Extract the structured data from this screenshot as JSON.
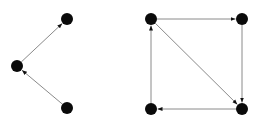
{
  "graphs": [
    {
      "name": "graph-left",
      "nodes": [
        {
          "id": "a",
          "label": "top"
        },
        {
          "id": "b",
          "label": "middle-left"
        },
        {
          "id": "c",
          "label": "bottom"
        }
      ],
      "edges": [
        {
          "from": "c",
          "to": "b"
        },
        {
          "from": "b",
          "to": "a"
        }
      ]
    },
    {
      "name": "graph-right",
      "nodes": [
        {
          "id": "tl",
          "label": "top-left"
        },
        {
          "id": "tr",
          "label": "top-right"
        },
        {
          "id": "br",
          "label": "bottom-right"
        },
        {
          "id": "bl",
          "label": "bottom-left"
        }
      ],
      "edges": [
        {
          "from": "tl",
          "to": "tr"
        },
        {
          "from": "tr",
          "to": "br"
        },
        {
          "from": "tl",
          "to": "br"
        },
        {
          "from": "br",
          "to": "bl"
        },
        {
          "from": "bl",
          "to": "tl"
        }
      ]
    }
  ],
  "colors": {
    "node": "#0a0a0a",
    "edge": "#8a8a8a",
    "background": "#ffffff"
  }
}
